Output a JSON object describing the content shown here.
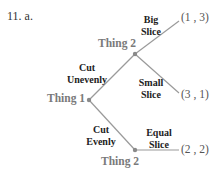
{
  "problem_label": "11. a.",
  "nodes": {
    "root": {
      "label": "Thing 1"
    },
    "top": {
      "label": "Thing 2"
    },
    "bottom": {
      "label": "Thing 2"
    }
  },
  "edges": {
    "cut_unevenly": {
      "line1": "Cut",
      "line2": "Unevenly"
    },
    "cut_evenly": {
      "line1": "Cut",
      "line2": "Evenly"
    },
    "big_slice": {
      "line1": "Big",
      "line2": "Slice"
    },
    "small_slice": {
      "line1": "Small",
      "line2": "Slice"
    },
    "equal_slice": {
      "line1": "Equal",
      "line2": "Slice"
    }
  },
  "payoffs": {
    "big_slice": "(1 , 3)",
    "small_slice": "(3 , 1)",
    "equal_slice": "(2 , 2)"
  },
  "colors": {
    "line": "#9a9a9a",
    "node_dot": "#8a8a8a",
    "node_label": "#7a7a7a",
    "edge_label": "#222222",
    "payoff": "#555555"
  }
}
